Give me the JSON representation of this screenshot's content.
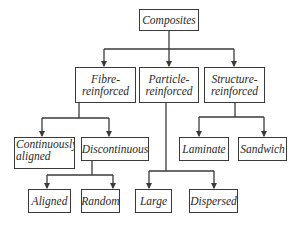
{
  "diagram": {
    "type": "tree",
    "root": {
      "id": "composites",
      "label": "Composites"
    },
    "nodes": {
      "composites": {
        "lines": [
          "Composites"
        ]
      },
      "fibre": {
        "lines": [
          "Fibre-",
          "reinforced"
        ]
      },
      "particle": {
        "lines": [
          "Particle-",
          "reinforced"
        ]
      },
      "structure": {
        "lines": [
          "Structure-",
          "reinforced"
        ]
      },
      "continuously_aligned": {
        "lines": [
          "Continuously",
          "aligned"
        ]
      },
      "discontinuous": {
        "lines": [
          "Discontinuous"
        ]
      },
      "laminate": {
        "lines": [
          "Laminate"
        ]
      },
      "sandwich": {
        "lines": [
          "Sandwich"
        ]
      },
      "aligned": {
        "lines": [
          "Aligned"
        ]
      },
      "random": {
        "lines": [
          "Random"
        ]
      },
      "large": {
        "lines": [
          "Large"
        ]
      },
      "dispersed": {
        "lines": [
          "Dispersed"
        ]
      }
    },
    "edges": [
      [
        "composites",
        "fibre"
      ],
      [
        "composites",
        "particle"
      ],
      [
        "composites",
        "structure"
      ],
      [
        "fibre",
        "continuously_aligned"
      ],
      [
        "fibre",
        "discontinuous"
      ],
      [
        "discontinuous",
        "aligned"
      ],
      [
        "discontinuous",
        "random"
      ],
      [
        "particle",
        "large"
      ],
      [
        "particle",
        "dispersed"
      ],
      [
        "structure",
        "laminate"
      ],
      [
        "structure",
        "sandwich"
      ]
    ],
    "colors": {
      "stroke": "#3a3a3a",
      "text": "#2a2a2a",
      "background": "#ffffff"
    }
  }
}
